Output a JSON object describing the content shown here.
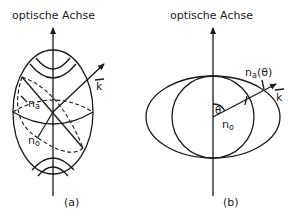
{
  "figure": {
    "panel_a": {
      "axis_label": "optische Achse",
      "vector_label": "k",
      "index_label_upper": "n",
      "index_label_upper_sub": "a",
      "index_label_lower": "n",
      "index_label_lower_sub": "o",
      "caption": "(a)"
    },
    "panel_b": {
      "axis_label": "optische Achse",
      "vector_label": "k",
      "angle_label": "θ",
      "index_label_extra": "n",
      "index_label_extra_sub": "a",
      "index_label_extra_arg": "(θ)",
      "index_label_ordinary": "n",
      "index_label_ordinary_sub": "o",
      "caption": "(b)"
    },
    "colors": {
      "ink": "#1a1a1a",
      "background": "#ffffff"
    }
  }
}
